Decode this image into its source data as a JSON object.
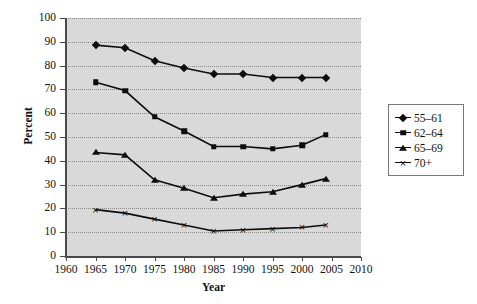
{
  "chart_data": {
    "type": "line",
    "title": "",
    "xlabel": "Year",
    "ylabel": "Percent",
    "xlim": [
      1960,
      2010
    ],
    "ylim": [
      0,
      100
    ],
    "grid": true,
    "legend_position": "right",
    "x": [
      1965,
      1970,
      1975,
      1980,
      1985,
      1990,
      1995,
      2000,
      2004
    ],
    "xticks": [
      1960,
      1965,
      1970,
      1975,
      1980,
      1985,
      1990,
      1995,
      2000,
      2005,
      2010
    ],
    "yticks": [
      0,
      10,
      20,
      30,
      40,
      50,
      60,
      70,
      80,
      90,
      100
    ],
    "series": [
      {
        "name": "55–61",
        "marker": "diamond",
        "values": [
          88.6,
          87.5,
          82.0,
          79.0,
          76.5,
          76.5,
          75.0,
          75.0,
          75.0
        ]
      },
      {
        "name": "62–64",
        "marker": "square",
        "values": [
          73.0,
          69.5,
          58.5,
          52.5,
          46.0,
          46.0,
          45.0,
          46.5,
          51.0
        ]
      },
      {
        "name": "65–69",
        "marker": "triangle",
        "values": [
          43.5,
          42.5,
          32.0,
          28.5,
          24.5,
          26.0,
          27.0,
          30.0,
          32.5
        ]
      },
      {
        "name": "70+",
        "marker": "cross",
        "values": [
          19.5,
          18.0,
          15.5,
          13.0,
          10.5,
          11.0,
          11.5,
          12.0,
          13.0
        ]
      }
    ]
  },
  "legend": {
    "items": [
      {
        "label": "55–61"
      },
      {
        "label": "62–64"
      },
      {
        "label": "65–69"
      },
      {
        "label": "70+"
      }
    ]
  },
  "colors": {
    "plot_background": "#d9d9d9",
    "page_background": "#ffffff",
    "series_ink": "#0d0d0d",
    "gridline": "#8a8a8a",
    "axis": "#4a4a4a"
  }
}
